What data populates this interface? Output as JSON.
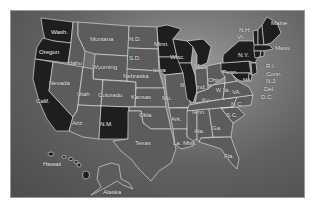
{
  "map": {
    "title": "United States map",
    "colors": {
      "dark_states": "#1e1e1e",
      "light_states": "#5c5c5c",
      "borders": "#e8e8e8",
      "background": "#6a6a6a"
    },
    "states": [
      {
        "id": "wa",
        "label": "Wash.",
        "shade": "dark"
      },
      {
        "id": "or",
        "label": "Oregon",
        "shade": "dark"
      },
      {
        "id": "ca",
        "label": "Calif.",
        "shade": "dark"
      },
      {
        "id": "id",
        "label": "Idaho",
        "shade": "light"
      },
      {
        "id": "nv",
        "label": "Nevada",
        "shade": "light"
      },
      {
        "id": "mt",
        "label": "Montana",
        "shade": "light"
      },
      {
        "id": "wy",
        "label": "Wyoming",
        "shade": "light"
      },
      {
        "id": "ut",
        "label": "Utah",
        "shade": "light"
      },
      {
        "id": "co",
        "label": "Colorado",
        "shade": "light"
      },
      {
        "id": "az",
        "label": "Ariz.",
        "shade": "light"
      },
      {
        "id": "nm",
        "label": "N.M.",
        "shade": "dark"
      },
      {
        "id": "nd",
        "label": "N.D.",
        "shade": "light"
      },
      {
        "id": "sd",
        "label": "S.D.",
        "shade": "light"
      },
      {
        "id": "ne",
        "label": "Nebraska",
        "shade": "light"
      },
      {
        "id": "ks",
        "label": "Kansas",
        "shade": "light"
      },
      {
        "id": "ok",
        "label": "Okla.",
        "shade": "light"
      },
      {
        "id": "tx",
        "label": "Texas",
        "shade": "light"
      },
      {
        "id": "mn",
        "label": "Minn.",
        "shade": "dark"
      },
      {
        "id": "ia",
        "label": "Iowa",
        "shade": "dark"
      },
      {
        "id": "mo",
        "label": "Mo.",
        "shade": "light"
      },
      {
        "id": "ar",
        "label": "Ark.",
        "shade": "light"
      },
      {
        "id": "la",
        "label": "La.",
        "shade": "light"
      },
      {
        "id": "wi",
        "label": "Wisc.",
        "shade": "dark"
      },
      {
        "id": "il",
        "label": "Ill.",
        "shade": "dark"
      },
      {
        "id": "mi",
        "label": "Mich.",
        "shade": "dark"
      },
      {
        "id": "in",
        "label": "Ind.",
        "shade": "light"
      },
      {
        "id": "oh",
        "label": "Ohio",
        "shade": "light"
      },
      {
        "id": "ky",
        "label": "Ky.",
        "shade": "light"
      },
      {
        "id": "tn",
        "label": "Tenn.",
        "shade": "light"
      },
      {
        "id": "ms",
        "label": "Miss.",
        "shade": "light"
      },
      {
        "id": "al",
        "label": "Ala.",
        "shade": "light"
      },
      {
        "id": "ga",
        "label": "Ga.",
        "shade": "light"
      },
      {
        "id": "fl",
        "label": "Fla.",
        "shade": "light"
      },
      {
        "id": "sc",
        "label": "S.C.",
        "shade": "light"
      },
      {
        "id": "nc",
        "label": "N.C.",
        "shade": "light"
      },
      {
        "id": "va",
        "label": "VA.",
        "shade": "light"
      },
      {
        "id": "wv",
        "label": "W. Va.",
        "shade": "light"
      },
      {
        "id": "pa",
        "label": "Penn.",
        "shade": "dark"
      },
      {
        "id": "ny",
        "label": "N.Y.",
        "shade": "dark"
      },
      {
        "id": "vt",
        "label": "Vt.",
        "shade": "dark"
      },
      {
        "id": "nh",
        "label": "N.H.",
        "shade": "dark"
      },
      {
        "id": "me",
        "label": "Maine",
        "shade": "dark"
      },
      {
        "id": "ma",
        "label": "Mass.",
        "shade": "dark"
      },
      {
        "id": "ri",
        "label": "R.I.",
        "shade": "dark"
      },
      {
        "id": "ct",
        "label": "Conn.",
        "shade": "dark"
      },
      {
        "id": "nj",
        "label": "N.J.",
        "shade": "dark"
      },
      {
        "id": "de",
        "label": "Del.",
        "shade": "dark"
      },
      {
        "id": "md",
        "label": "Md.",
        "shade": "dark"
      },
      {
        "id": "dc",
        "label": "D.C.",
        "shade": "dark"
      },
      {
        "id": "hi",
        "label": "Hawaii",
        "shade": "dark"
      },
      {
        "id": "ak",
        "label": "Alaska",
        "shade": "light"
      }
    ]
  }
}
